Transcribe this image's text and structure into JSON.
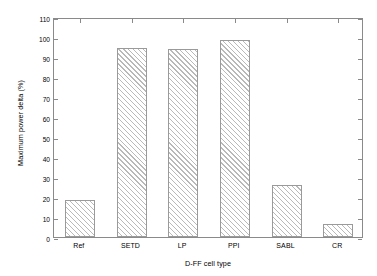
{
  "chart_data": {
    "type": "bar",
    "title": "",
    "subtitle": "",
    "xlabel": "D-FF cell type",
    "ylabel": "Maximum power delta (%)",
    "categories": [
      "Ref",
      "SETD",
      "LP",
      "PPI",
      "SABL",
      "CR"
    ],
    "values": [
      18.5,
      94.5,
      94.0,
      98.5,
      26.0,
      6.5
    ],
    "ylim": [
      0,
      110
    ],
    "ytick_values": [
      0,
      10,
      20,
      30,
      40,
      50,
      60,
      70,
      80,
      90,
      100,
      110
    ],
    "ytick_labels": [
      "0",
      "10",
      "20",
      "30",
      "40",
      "50",
      "60",
      "70",
      "80",
      "90",
      "100",
      "110"
    ],
    "grid": false,
    "legend": null,
    "bar_style": {
      "fill": "#ffffff",
      "edge_color": "#9a9a9a",
      "hatch": "/",
      "hatch_color": "#b9b9b9"
    },
    "frame_color": "#8a8a8a",
    "background": "#ffffff",
    "annotations": []
  }
}
